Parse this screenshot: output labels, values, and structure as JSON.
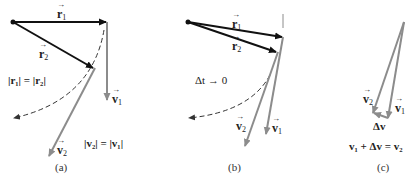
{
  "figure": {
    "panels": [
      {
        "id": "a",
        "caption": "(a)",
        "labels": {
          "r1": {
            "sym": "r",
            "sub": "1"
          },
          "r2": {
            "sym": "r",
            "sub": "2"
          },
          "v1": {
            "sym": "v",
            "sub": "1"
          },
          "v2": {
            "sym": "v",
            "sub": "2"
          },
          "eq_r": "|r₁| = |r₂|",
          "eq_v": "|v₂| = |v₁|"
        }
      },
      {
        "id": "b",
        "caption": "(b)",
        "labels": {
          "r1": {
            "sym": "r",
            "sub": "1"
          },
          "r2": {
            "sym": "r",
            "sub": "2"
          },
          "v1": {
            "sym": "v",
            "sub": "1"
          },
          "v2": {
            "sym": "v",
            "sub": "2"
          },
          "limit": "Δt → 0"
        }
      },
      {
        "id": "c",
        "caption": "(c)",
        "labels": {
          "v1": {
            "sym": "v",
            "sub": "1"
          },
          "v2": {
            "sym": "v",
            "sub": "2"
          },
          "dv": "Δv",
          "equation": "v₁ + Δv = v₂"
        }
      }
    ],
    "colors": {
      "position_vector": "#111111",
      "velocity_vector": "#8c8c8c",
      "path_dashed": "#333333",
      "text": "#222222"
    }
  }
}
